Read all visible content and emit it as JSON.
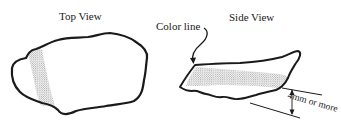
{
  "diagram": {
    "panels": [
      {
        "id": "top-view",
        "title": "Top View",
        "shape": "irregular flake outline with stippled band near left end"
      },
      {
        "id": "side-view",
        "title": "Side View",
        "shape": "thin wedge-shaped flake with stippled color band",
        "callout": {
          "label": "Color line",
          "pointer": "curved-arrow"
        },
        "dimension": {
          "label": "4mm or more",
          "type": "thickness-indicator"
        }
      }
    ],
    "colors": {
      "outline": "#1a1a1a",
      "stipple": "#555555",
      "background": "#ffffff"
    }
  }
}
